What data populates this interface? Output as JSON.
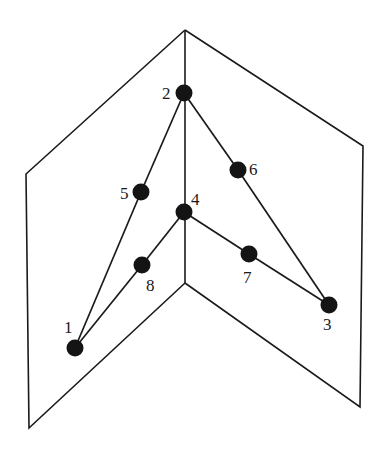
{
  "diagram": {
    "planes": {
      "left": [
        [
          185,
          30
        ],
        [
          26,
          174
        ],
        [
          29,
          428
        ],
        [
          185,
          283
        ]
      ],
      "right": [
        [
          185,
          30
        ],
        [
          363,
          146
        ],
        [
          360,
          407
        ],
        [
          185,
          283
        ]
      ],
      "fold": [
        [
          185,
          30
        ],
        [
          185,
          283
        ]
      ]
    },
    "nodes": [
      {
        "id": "1",
        "label": "1",
        "x": 75,
        "y": 348,
        "lx": 64,
        "ly": 333
      },
      {
        "id": "2",
        "label": "2",
        "x": 184,
        "y": 93,
        "lx": 162,
        "ly": 99
      },
      {
        "id": "3",
        "label": "3",
        "x": 329,
        "y": 305,
        "lx": 323,
        "ly": 330
      },
      {
        "id": "4",
        "label": "4",
        "x": 184,
        "y": 212,
        "lx": 191,
        "ly": 205
      },
      {
        "id": "5",
        "label": "5",
        "x": 141,
        "y": 192,
        "lx": 120,
        "ly": 199
      },
      {
        "id": "6",
        "label": "6",
        "x": 238,
        "y": 170,
        "lx": 249,
        "ly": 175
      },
      {
        "id": "7",
        "label": "7",
        "x": 249,
        "y": 254,
        "lx": 243,
        "ly": 283
      },
      {
        "id": "8",
        "label": "8",
        "x": 142,
        "y": 265,
        "lx": 146,
        "ly": 291
      }
    ],
    "edges": [
      [
        "1",
        "5"
      ],
      [
        "5",
        "2"
      ],
      [
        "2",
        "6"
      ],
      [
        "6",
        "3"
      ],
      [
        "1",
        "8"
      ],
      [
        "8",
        "4"
      ],
      [
        "4",
        "7"
      ],
      [
        "7",
        "3"
      ]
    ]
  }
}
